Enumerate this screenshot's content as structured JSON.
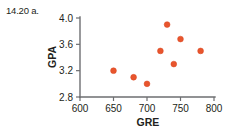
{
  "figure": {
    "exercise_label": "14.20 a.",
    "point_color": "#e8552d",
    "axis_color": "#6d6e71",
    "text_color": "#231f20",
    "background": "#ffffff"
  },
  "chart_data": {
    "type": "scatter",
    "title": "",
    "xlabel": "GRE",
    "ylabel": "GPA",
    "xlim": [
      600,
      800
    ],
    "ylim": [
      2.8,
      4.0
    ],
    "xticks": [
      600,
      650,
      700,
      750,
      800
    ],
    "yticks": [
      2.8,
      3.2,
      3.6,
      4.0
    ],
    "xtick_labels": [
      "600",
      "650",
      "700",
      "750",
      "800"
    ],
    "ytick_labels": [
      "2.8",
      "3.2",
      "3.6",
      "4.0"
    ],
    "grid": false,
    "legend": null,
    "x": [
      650,
      680,
      700,
      720,
      730,
      740,
      750,
      780
    ],
    "y": [
      3.2,
      3.1,
      3.0,
      3.5,
      3.9,
      3.3,
      3.68,
      3.5
    ],
    "points": [
      {
        "x": 650,
        "y": 3.2
      },
      {
        "x": 680,
        "y": 3.1
      },
      {
        "x": 700,
        "y": 3.0
      },
      {
        "x": 720,
        "y": 3.5
      },
      {
        "x": 730,
        "y": 3.9
      },
      {
        "x": 740,
        "y": 3.3
      },
      {
        "x": 750,
        "y": 3.68
      },
      {
        "x": 780,
        "y": 3.5
      }
    ]
  }
}
